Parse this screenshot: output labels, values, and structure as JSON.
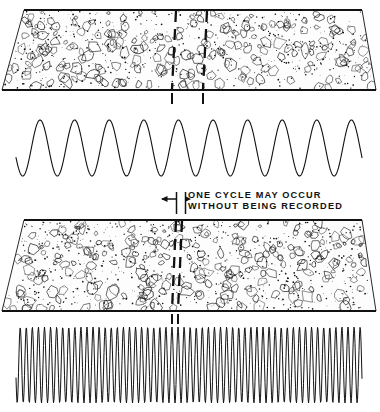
{
  "figure": {
    "background_color": "#ffffff",
    "ink_color": "#111111",
    "width": 380,
    "height": 412
  },
  "annotation": {
    "line1": "ONE CYCLE MAY OCCUR",
    "line2": "WITHOUT BEING RECORDED",
    "left_arrow_icon": "arrow-left-icon",
    "right_arrow_icon": "arrow-right-icon",
    "leader_bar_icon": "vertical-leader-bar-icon"
  },
  "panels": [
    {
      "id": "upper",
      "name": "low-frequency-panel",
      "band": {
        "name": "aggregate-texture-band-upper",
        "top_y": 10,
        "bottom_y": 90,
        "top_left_x": 24,
        "top_right_x": 362,
        "bottom_left_x": 2,
        "bottom_right_x": 376,
        "fill": "#fdfdfd",
        "edge_color": "#111111",
        "texture": "aggregate-stipple"
      },
      "markers": {
        "name": "sample-marker-pair-upper",
        "positions_x": [
          176,
          207
        ],
        "style": "dashed",
        "spacing_px": 31,
        "tick_top_y": 93,
        "tick_bottom_y": 104
      },
      "wave": {
        "name": "low-frequency-waveform",
        "cycles": 10,
        "start_x": 16,
        "end_x": 362,
        "baseline_y": 148,
        "amplitude": 28,
        "period_px": 34.6,
        "phase_offset_deg": 200,
        "stroke_width": 1.1
      }
    },
    {
      "id": "lower",
      "name": "high-frequency-panel",
      "band": {
        "name": "aggregate-texture-band-lower",
        "top_y": 220,
        "bottom_y": 311,
        "top_left_x": 24,
        "top_right_x": 362,
        "bottom_left_x": 2,
        "bottom_right_x": 376,
        "fill": "#fdfdfd",
        "edge_color": "#111111",
        "texture": "aggregate-stipple"
      },
      "markers": {
        "name": "sample-marker-pair-lower",
        "positions_x": [
          176,
          182
        ],
        "style": "dashed",
        "spacing_px": 6,
        "tick_top_y": 314,
        "tick_bottom_y": 324
      },
      "wave": {
        "name": "high-frequency-waveform",
        "cycles": 57,
        "start_x": 16,
        "end_x": 362,
        "baseline_y": 365,
        "amplitude": 38,
        "period_px": 6.07,
        "phase_offset_deg": 200,
        "stroke_width": 1.0
      }
    }
  ]
}
